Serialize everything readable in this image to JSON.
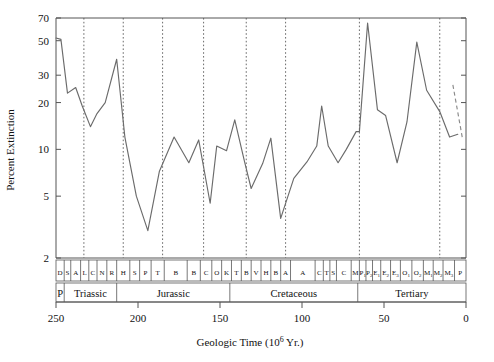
{
  "chart_data": {
    "type": "line",
    "title": "",
    "xlabel": "Geologic Time (10⁶ Yr.)",
    "ylabel": "Percent Extinction",
    "xlim": [
      250,
      0
    ],
    "ylim": [
      2,
      70
    ],
    "yscale": "log",
    "xscale": "linear",
    "grid": false,
    "legend": "none",
    "xticks": [
      250,
      200,
      150,
      100,
      50,
      0
    ],
    "xticklabels": [
      "250",
      "200",
      "150",
      "100",
      "50",
      "0"
    ],
    "yticks": [
      2,
      5,
      10,
      20,
      30,
      50,
      70
    ],
    "yticklabels": [
      "2",
      "5",
      "10",
      "20",
      "30",
      "50",
      "70"
    ],
    "series": [
      {
        "name": "Percent Extinction",
        "style": "solid",
        "x": [
          250.0,
          247.0,
          243.0,
          238.0,
          234.0,
          229.0,
          225.0,
          220.0,
          213.0,
          208.0,
          201.0,
          194.0,
          187.0,
          178.0,
          169.0,
          163.0,
          156.0,
          152.0,
          146.0,
          141.0,
          135.0,
          131.0,
          124.0,
          119.0,
          113.0,
          105.0,
          97.0,
          91.0,
          88.0,
          84.0,
          78.0,
          73.0,
          67.0,
          65.0,
          60.0,
          54.0,
          49.0,
          42.0,
          36.0,
          30.0,
          24.0,
          16.0,
          10.0,
          5.0
        ],
        "y": [
          52.0,
          51.0,
          23.0,
          25.0,
          19.0,
          14.0,
          17.0,
          20.0,
          38.0,
          12.0,
          5.0,
          3.0,
          7.2,
          12.0,
          8.2,
          11.5,
          4.5,
          10.5,
          9.8,
          15.5,
          8.3,
          5.6,
          8.1,
          11.8,
          3.6,
          6.5,
          8.3,
          10.5,
          19.0,
          10.5,
          8.2,
          10.0,
          13.0,
          13.0,
          65.0,
          18.0,
          16.5,
          8.2,
          15.0,
          49.0,
          24.0,
          17.5,
          12.0,
          12.5
        ],
        "description": "Percent of marine animal families (or genera) going extinct per stratigraphic stage, plotted on a log scale against geologic time running from 250 Myr ago (left) to present (right)."
      },
      {
        "name": "Recent trend (dashed)",
        "style": "dashed",
        "x": [
          8.0,
          2.0
        ],
        "y": [
          26.0,
          11.5
        ],
        "description": "Short dashed segment at the right (youngest) end of the curve."
      }
    ],
    "event_markers": {
      "description": "Vertical dotted lines marking major mass-extinction / stage boundaries",
      "x": [
        233.0,
        209.0,
        185.0,
        160.0,
        134.0,
        110.0,
        65.0,
        16.0
      ]
    },
    "stage_strip": {
      "description": "Upper strip: stratigraphic stage abbreviations; each cell spans one stage.",
      "cells": [
        {
          "label": "D",
          "start": 250.0,
          "end": 245.0
        },
        {
          "label": "S",
          "start": 245.0,
          "end": 241.0
        },
        {
          "label": "A",
          "start": 241.0,
          "end": 235.0
        },
        {
          "label": "L",
          "start": 235.0,
          "end": 230.0
        },
        {
          "label": "C",
          "start": 230.0,
          "end": 225.0
        },
        {
          "label": "N",
          "start": 225.0,
          "end": 219.0
        },
        {
          "label": "R",
          "start": 219.0,
          "end": 213.0
        },
        {
          "label": "H",
          "start": 213.0,
          "end": 205.0
        },
        {
          "label": "S",
          "start": 205.0,
          "end": 199.0
        },
        {
          "label": "P",
          "start": 199.0,
          "end": 192.0
        },
        {
          "label": "T",
          "start": 192.0,
          "end": 184.0
        },
        {
          "label": "B",
          "start": 184.0,
          "end": 170.0
        },
        {
          "label": "B",
          "start": 170.0,
          "end": 162.0
        },
        {
          "label": "C",
          "start": 162.0,
          "end": 155.0
        },
        {
          "label": "O",
          "start": 155.0,
          "end": 149.0
        },
        {
          "label": "K",
          "start": 149.0,
          "end": 143.0
        },
        {
          "label": "T",
          "start": 143.0,
          "end": 137.0
        },
        {
          "label": "B",
          "start": 137.0,
          "end": 131.0
        },
        {
          "label": "V",
          "start": 131.0,
          "end": 125.0
        },
        {
          "label": "H",
          "start": 125.0,
          "end": 119.0
        },
        {
          "label": "B",
          "start": 119.0,
          "end": 113.0
        },
        {
          "label": "A",
          "start": 113.0,
          "end": 107.0
        },
        {
          "label": "A",
          "start": 107.0,
          "end": 92.0
        },
        {
          "label": "C",
          "start": 92.0,
          "end": 87.0
        },
        {
          "label": "T",
          "start": 87.0,
          "end": 83.0
        },
        {
          "label": "S",
          "start": 83.0,
          "end": 79.0
        },
        {
          "label": "C",
          "start": 79.0,
          "end": 70.0
        },
        {
          "label": "M",
          "start": 70.0,
          "end": 65.0
        },
        {
          "label": "P",
          "sub": "1",
          "start": 65.0,
          "end": 61.0
        },
        {
          "label": "P",
          "sub": "2",
          "start": 61.0,
          "end": 57.0
        },
        {
          "label": "E",
          "sub": "1",
          "start": 57.0,
          "end": 52.0
        },
        {
          "label": "E",
          "sub": "2",
          "start": 52.0,
          "end": 46.0
        },
        {
          "label": "E",
          "sub": "3",
          "start": 46.0,
          "end": 40.0
        },
        {
          "label": "O",
          "sub": "1",
          "start": 40.0,
          "end": 33.0
        },
        {
          "label": "O",
          "sub": "2",
          "start": 33.0,
          "end": 26.0
        },
        {
          "label": "M",
          "sub": "1",
          "start": 26.0,
          "end": 20.0
        },
        {
          "label": "M",
          "sub": "2",
          "start": 20.0,
          "end": 14.0
        },
        {
          "label": "M",
          "sub": "3",
          "start": 14.0,
          "end": 7.0
        },
        {
          "label": "P",
          "start": 7.0,
          "end": 0.0
        }
      ]
    },
    "period_strip": {
      "description": "Lower strip: geologic period names",
      "cells": [
        {
          "label": "P",
          "start": 250.0,
          "end": 245.0
        },
        {
          "label": "Triassic",
          "start": 245.0,
          "end": 213.0
        },
        {
          "label": "Jurassic",
          "start": 213.0,
          "end": 144.0
        },
        {
          "label": "Cretaceous",
          "start": 144.0,
          "end": 66.0
        },
        {
          "label": "Tertiary",
          "start": 66.0,
          "end": 0.0
        }
      ]
    },
    "colors": {
      "line": "#6b6b6b",
      "axis": "#555555",
      "text": "#111111",
      "background": "#ffffff"
    }
  }
}
